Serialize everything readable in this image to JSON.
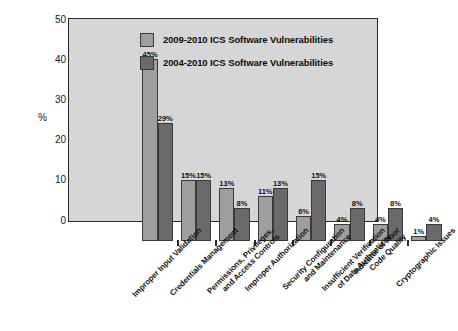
{
  "chart_data": {
    "type": "bar",
    "title": "",
    "xlabel": "",
    "ylabel": "%",
    "ylim": [
      0,
      50
    ],
    "yticks": [
      0,
      10,
      20,
      30,
      40,
      50
    ],
    "grid": false,
    "legend_position": "top-center",
    "categories": [
      "Improper Input Validation",
      "Credentials Management",
      "Permissions, Privileges,\nand Access Controls",
      "Improper Authorization",
      "Security Configuration\nand Maintenance",
      "Insufficient Verification\nof Data Authenticity",
      "Indicator of Poor\nCode Quality",
      "Cryptographic Issues"
    ],
    "series": [
      {
        "name": "2009-2010 ICS Software Vulnerabilities",
        "color": "#9e9e9e",
        "values": [
          45,
          15,
          13,
          11,
          6,
          4,
          4,
          1
        ],
        "labels": [
          "45%",
          "15%",
          "13%",
          "11%",
          "6%",
          "4%",
          "4%",
          "1%"
        ]
      },
      {
        "name": "2004-2010 ICS Software Vulnerabilities",
        "color": "#6a6a6a",
        "values": [
          29,
          15,
          8,
          13,
          15,
          8,
          8,
          4
        ],
        "labels": [
          "29%",
          "15%",
          "8%",
          "13%",
          "15%",
          "8%",
          "8%",
          "4%"
        ]
      }
    ]
  },
  "colors": {
    "plot_background": "#d6d6d6",
    "axis": "#2a2a2a",
    "series_light": "#9e9e9e",
    "series_dark": "#6a6a6a",
    "page_background": "#ffffff"
  }
}
